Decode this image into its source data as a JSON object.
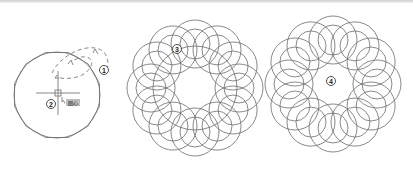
{
  "figure": {
    "background": "#ffffff",
    "line_color": "#6b6b6b",
    "steps": [
      {
        "id": "step-1",
        "label": "1",
        "x": 104,
        "y": 70
      },
      {
        "id": "step-2",
        "label": "2",
        "x": 51,
        "y": 104
      },
      {
        "id": "step-3",
        "label": "3",
        "x": 177,
        "y": 49
      },
      {
        "id": "step-4",
        "label": "4",
        "x": 331,
        "y": 81
      }
    ],
    "snap_tooltip": {
      "text": "圆心",
      "x": 66,
      "y": 99,
      "bg": "#bdbdbd"
    },
    "panel_1": {
      "circle": {
        "cx": 57,
        "cy": 95,
        "r": 43
      },
      "polygon_sides": 12,
      "crosshair": {
        "cx": 58,
        "cy": 93,
        "size": 22,
        "box": 6
      }
    },
    "panel_2": {
      "cx": 195,
      "cy": 88,
      "guide_r": 42,
      "loop_count": 12,
      "loop_center_r": 44,
      "loop_outer_r": 24,
      "loop_inner_r": 15
    },
    "panel_3": {
      "cx": 333,
      "cy": 84,
      "guide_r": 42,
      "loop_count": 12,
      "loop_center_r": 44,
      "loop_outer_r": 24,
      "loop_inner_r": 15
    }
  }
}
